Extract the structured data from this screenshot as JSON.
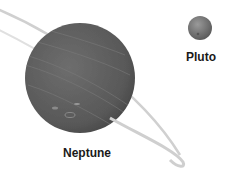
{
  "diagram": {
    "bodies": [
      {
        "name": "Neptune",
        "cx": 80,
        "cy": 78,
        "r": 55,
        "color": "#5e5e5e",
        "label_x": 87,
        "label_y": 146
      },
      {
        "name": "Pluto",
        "cx": 200,
        "cy": 28,
        "r": 12,
        "color": "#7a7a7a",
        "label_x": 201,
        "label_y": 50
      }
    ],
    "labels": {
      "neptune": "Neptune",
      "pluto": "Pluto"
    },
    "ring_color": "#cfcfcf"
  }
}
